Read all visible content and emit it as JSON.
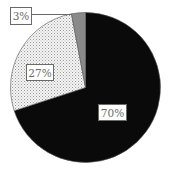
{
  "chart_data": {
    "type": "pie",
    "title": "",
    "categories": [
      "Slice A",
      "Slice B",
      "Slice C"
    ],
    "values": [
      70,
      27,
      3
    ],
    "labels": [
      "70%",
      "27%",
      "3%"
    ],
    "colors": [
      "#0a0a0a",
      "dotted-light",
      "#8a8a8a"
    ],
    "start_angle_deg": 0,
    "direction": "clockwise",
    "legend": "none",
    "label_boxes": true
  },
  "colors": {
    "slice_dark": "#0a0a0a",
    "slice_gray": "#8a8a8a",
    "slice_dots_bg": "#f4f4f4",
    "slice_dots_fg": "#9a9a9a",
    "label_border": "#6a6a6a",
    "label_text": "#6a6a6a"
  },
  "labels": {
    "slice_70": "70%",
    "slice_27": "27%",
    "slice_3": "3%"
  }
}
